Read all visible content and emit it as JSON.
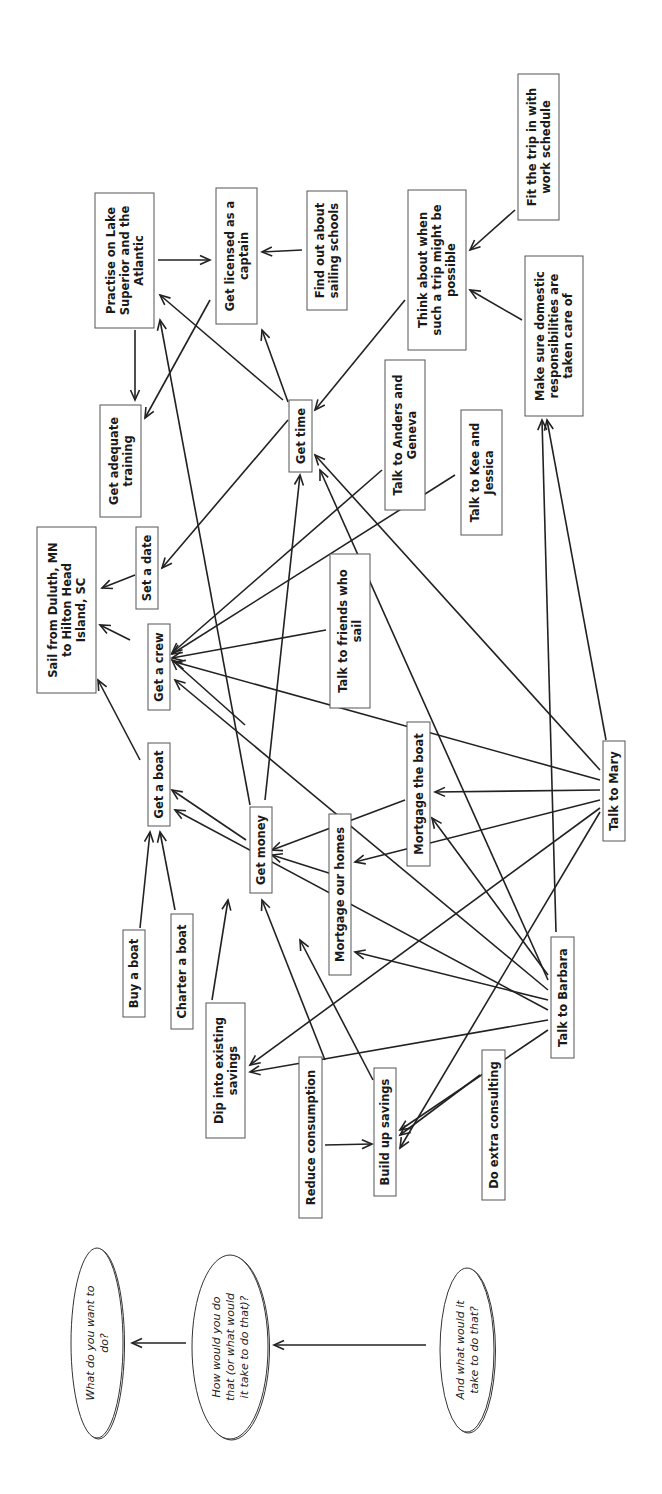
{
  "diagram": {
    "orientation": "rotated-90-ccw",
    "nodes": [
      {
        "id": "goal",
        "lines": [
          "Sail from Duluth, MN",
          "to Hilton Head",
          "Island, SC"
        ],
        "x": 37,
        "y": 527,
        "w": 59,
        "h": 166
      },
      {
        "id": "practise",
        "lines": [
          "Practise on Lake",
          "Superior and the",
          "Atlantic"
        ],
        "x": 95,
        "y": 193,
        "w": 59,
        "h": 135
      },
      {
        "id": "licensed",
        "lines": [
          "Get licensed as a",
          "captain"
        ],
        "x": 216,
        "y": 188,
        "w": 41,
        "h": 136
      },
      {
        "id": "schools",
        "lines": [
          "Find out about",
          "sailing schools"
        ],
        "x": 307,
        "y": 191,
        "w": 40,
        "h": 119
      },
      {
        "id": "think",
        "lines": [
          "Think about when",
          "such a trip might be",
          "possible"
        ],
        "x": 408,
        "y": 190,
        "w": 58,
        "h": 160
      },
      {
        "id": "fit",
        "lines": [
          "Fit the trip in with",
          "work schedule"
        ],
        "x": 518,
        "y": 74,
        "w": 41,
        "h": 146
      },
      {
        "id": "domestic",
        "lines": [
          "Make sure domestic",
          "responsibilities are",
          "taken care of"
        ],
        "x": 525,
        "y": 256,
        "w": 58,
        "h": 160
      },
      {
        "id": "training",
        "lines": [
          "Get adequate",
          "training"
        ],
        "x": 100,
        "y": 405,
        "w": 41,
        "h": 112
      },
      {
        "id": "time",
        "lines": [
          "Get time"
        ],
        "x": 289,
        "y": 400,
        "w": 23,
        "h": 72
      },
      {
        "id": "date",
        "lines": [
          "Set a date"
        ],
        "x": 136,
        "y": 527,
        "w": 22,
        "h": 82
      },
      {
        "id": "crew",
        "lines": [
          "Get a crew"
        ],
        "x": 148,
        "y": 624,
        "w": 22,
        "h": 86
      },
      {
        "id": "anders",
        "lines": [
          "Talk to Anders and",
          "Geneva"
        ],
        "x": 385,
        "y": 360,
        "w": 40,
        "h": 150
      },
      {
        "id": "kee",
        "lines": [
          "Talk to Kee and",
          "Jessica"
        ],
        "x": 461,
        "y": 410,
        "w": 41,
        "h": 125
      },
      {
        "id": "friends",
        "lines": [
          "Talk to friends who",
          "sail"
        ],
        "x": 330,
        "y": 554,
        "w": 40,
        "h": 154
      },
      {
        "id": "boat",
        "lines": [
          "Get a boat"
        ],
        "x": 148,
        "y": 743,
        "w": 22,
        "h": 83
      },
      {
        "id": "money",
        "lines": [
          "Get money"
        ],
        "x": 250,
        "y": 807,
        "w": 22,
        "h": 86
      },
      {
        "id": "homes",
        "lines": [
          "Mortgage our homes"
        ],
        "x": 329,
        "y": 814,
        "w": 22,
        "h": 161
      },
      {
        "id": "mboat",
        "lines": [
          "Mortgage the boat"
        ],
        "x": 407,
        "y": 722,
        "w": 23,
        "h": 144
      },
      {
        "id": "mary",
        "lines": [
          "Talk to Mary"
        ],
        "x": 603,
        "y": 741,
        "w": 22,
        "h": 100
      },
      {
        "id": "buy",
        "lines": [
          "Buy a boat"
        ],
        "x": 123,
        "y": 930,
        "w": 22,
        "h": 87
      },
      {
        "id": "charter",
        "lines": [
          "Charter a boat"
        ],
        "x": 171,
        "y": 914,
        "w": 22,
        "h": 115
      },
      {
        "id": "dip",
        "lines": [
          "Dip into existing",
          "savings"
        ],
        "x": 206,
        "y": 1003,
        "w": 39,
        "h": 135
      },
      {
        "id": "reduce",
        "lines": [
          "Reduce consumption"
        ],
        "x": 299,
        "y": 1057,
        "w": 23,
        "h": 161
      },
      {
        "id": "build",
        "lines": [
          "Build up savings"
        ],
        "x": 374,
        "y": 1068,
        "w": 22,
        "h": 128
      },
      {
        "id": "consult",
        "lines": [
          "Do extra consulting"
        ],
        "x": 482,
        "y": 1050,
        "w": 23,
        "h": 150
      },
      {
        "id": "barbara",
        "lines": [
          "Talk to Barbara"
        ],
        "x": 551,
        "y": 937,
        "w": 23,
        "h": 121
      }
    ],
    "edges": [
      [
        135,
        330,
        135,
        400
      ],
      [
        140,
        402,
        130,
        420,
        0
      ],
      [
        158,
        260,
        210,
        260
      ],
      [
        302,
        250,
        262,
        252
      ],
      [
        210,
        300,
        145,
        418
      ],
      [
        283,
        400,
        160,
        295
      ],
      [
        288,
        402,
        262,
        330
      ],
      [
        288,
        420,
        162,
        568
      ],
      [
        135,
        575,
        102,
        588
      ],
      [
        130,
        640,
        100,
        625
      ],
      [
        140,
        760,
        98,
        680
      ],
      [
        405,
        300,
        315,
        410
      ],
      [
        515,
        210,
        470,
        250
      ],
      [
        522,
        320,
        470,
        290
      ],
      [
        382,
        470,
        172,
        653
      ],
      [
        455,
        475,
        172,
        654
      ],
      [
        326,
        630,
        172,
        658
      ],
      [
        245,
        725,
        172,
        660
      ],
      [
        246,
        840,
        172,
        790
      ],
      [
        265,
        800,
        300,
        475
      ],
      [
        250,
        805,
        160,
        320
      ],
      [
        140,
        928,
        150,
        832
      ],
      [
        175,
        910,
        160,
        832
      ],
      [
        212,
        1000,
        228,
        900
      ],
      [
        325,
        1060,
        262,
        900
      ],
      [
        335,
        875,
        272,
        855
      ],
      [
        405,
        800,
        272,
        850
      ],
      [
        600,
        790,
        435,
        792
      ],
      [
        600,
        800,
        355,
        862
      ],
      [
        600,
        808,
        250,
        1065
      ],
      [
        600,
        812,
        400,
        1148
      ],
      [
        600,
        780,
        175,
        662
      ],
      [
        600,
        770,
        315,
        455
      ],
      [
        606,
        740,
        547,
        420
      ],
      [
        556,
        932,
        542,
        420
      ],
      [
        548,
        980,
        320,
        470
      ],
      [
        548,
        990,
        175,
        680
      ],
      [
        548,
        975,
        432,
        818
      ],
      [
        548,
        1000,
        355,
        952
      ],
      [
        548,
        1010,
        175,
        810
      ],
      [
        548,
        1020,
        250,
        1072
      ],
      [
        548,
        1030,
        400,
        1130
      ],
      [
        480,
        1075,
        400,
        1135
      ],
      [
        325,
        1145,
        372,
        1144
      ],
      [
        373,
        1080,
        300,
        940
      ]
    ],
    "legend": {
      "ellipses": [
        {
          "id": "q1",
          "lines": [
            "What do you want to",
            "do?"
          ],
          "cx": 97,
          "cy": 1343,
          "rx": 26,
          "ry": 95
        },
        {
          "id": "q2",
          "lines": [
            "How would you do",
            "that (or what would",
            "it take to do that)?"
          ],
          "cx": 230,
          "cy": 1347,
          "rx": 38,
          "ry": 92
        },
        {
          "id": "q3",
          "lines": [
            "And what would it",
            "take to do that?"
          ],
          "cx": 467,
          "cy": 1350,
          "rx": 27,
          "ry": 82
        }
      ],
      "arrows": [
        [
          186,
          1343,
          132,
          1343
        ],
        [
          426,
          1345,
          274,
          1345
        ]
      ]
    }
  }
}
